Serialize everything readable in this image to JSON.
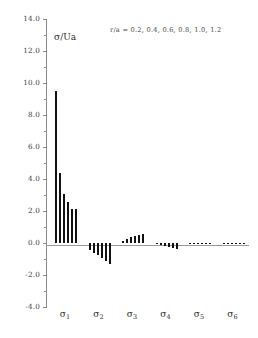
{
  "chart_data": {
    "type": "bar",
    "title": "",
    "subtitle": "",
    "xlabel": "",
    "ylabel": "σ/Ua",
    "ylim": [
      -4.0,
      14.0
    ],
    "ytick_labels": [
      "14.0",
      "12.0",
      "10.0",
      "8.0",
      "6.0",
      "4.0",
      "2.0",
      "0.0",
      "-2.0",
      "-4.0"
    ],
    "ytick_values": [
      14.0,
      12.0,
      10.0,
      8.0,
      6.0,
      4.0,
      2.0,
      0.0,
      -2.0,
      -4.0
    ],
    "grid": false,
    "legend_position": "top-right",
    "annotation": "r/a  =  0.2,  0.4,  0.6,  0.8,  1.0,  1.2",
    "categories": [
      "σ",
      "σ",
      "σ",
      "σ",
      "σ",
      "σ"
    ],
    "category_subscripts": [
      "1",
      "2",
      "3",
      "4",
      "5",
      "6"
    ],
    "series": [
      {
        "name": "r/a = 0.2",
        "values": [
          9.5,
          -0.45,
          0.15,
          -0.08,
          0.02,
          -0.03
        ]
      },
      {
        "name": "r/a = 0.4",
        "values": [
          4.35,
          -0.6,
          0.25,
          -0.14,
          0.02,
          -0.03
        ]
      },
      {
        "name": "r/a = 0.6",
        "values": [
          3.05,
          -0.75,
          0.35,
          -0.2,
          0.02,
          -0.04
        ]
      },
      {
        "name": "r/a = 0.8",
        "values": [
          2.55,
          -0.95,
          0.42,
          -0.26,
          0.02,
          -0.05
        ]
      },
      {
        "name": "r/a = 1.0",
        "values": [
          2.15,
          -1.1,
          0.52,
          -0.32,
          0.02,
          -0.05
        ]
      },
      {
        "name": "r/a = 1.2",
        "values": [
          2.1,
          -1.3,
          0.55,
          -0.35,
          0.02,
          -0.06
        ]
      }
    ],
    "bar_color": "#111111",
    "axis_color": "#8a8a8a"
  }
}
